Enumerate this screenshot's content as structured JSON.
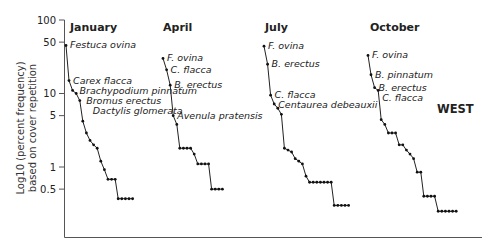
{
  "chart_data": {
    "type": "line",
    "title": "",
    "region_label": "WEST",
    "ylabel_line1": "Log10 (percent frequency)",
    "ylabel_line2": "based on cover repetition",
    "yscale": "log",
    "ylim": [
      0.2,
      100
    ],
    "yticks": [
      100,
      50,
      10,
      5,
      1,
      0.5
    ],
    "ytick_labels": [
      "100",
      "50",
      "10",
      "5",
      "1",
      "0.5"
    ],
    "xlabel": "",
    "grid": false,
    "legend": "none",
    "panels": [
      {
        "name": "January",
        "x_start": 66,
        "label_x": 70,
        "values": [
          45,
          15,
          11,
          10,
          8,
          4.2,
          2.9,
          2.3,
          2.0,
          1.8,
          1.2,
          0.92,
          0.68,
          0.68,
          0.68,
          0.37,
          0.37,
          0.37,
          0.37,
          0.37
        ],
        "annotations": [
          {
            "text": "Festuca ovina",
            "index": 0
          },
          {
            "text": "Carex flacca",
            "index": 1
          },
          {
            "text": "Brachypodium pinnatum",
            "index": 2
          },
          {
            "text": "Bromus erectus",
            "index": 3
          },
          {
            "text": "Dactylis glomerata",
            "index": 4
          }
        ]
      },
      {
        "name": "April",
        "x_start": 163,
        "label_x": 163,
        "values": [
          30,
          21,
          13,
          5.0,
          3.8,
          1.8,
          1.8,
          1.8,
          1.8,
          1.5,
          1.1,
          1.1,
          1.1,
          1.1,
          0.5,
          0.5,
          0.5,
          0.5
        ],
        "annotations": [
          {
            "text": "F. ovina",
            "index": 0
          },
          {
            "text": "C. flacca",
            "index": 1
          },
          {
            "text": "B. erectus",
            "index": 2
          },
          {
            "text": "Avenula pratensis",
            "index": 3
          }
        ]
      },
      {
        "name": "July",
        "x_start": 264,
        "label_x": 265,
        "values": [
          44,
          25,
          9.5,
          7.2,
          6.3,
          5.2,
          1.8,
          1.7,
          1.6,
          1.3,
          1.2,
          1.1,
          0.75,
          0.62,
          0.62,
          0.62,
          0.62,
          0.62,
          0.62,
          0.62,
          0.3,
          0.3,
          0.3,
          0.3,
          0.3
        ],
        "annotations": [
          {
            "text": "F. ovina",
            "index": 0
          },
          {
            "text": "B. erectus",
            "index": 1
          },
          {
            "text": "C. flacca",
            "index": 2
          },
          {
            "text": "Centaurea debeauxii",
            "index": 3
          }
        ]
      },
      {
        "name": "October",
        "x_start": 368,
        "label_x": 370,
        "values": [
          33,
          18,
          12,
          11,
          4.4,
          3.8,
          2.9,
          2.9,
          2.9,
          2.0,
          2.0,
          1.7,
          1.5,
          1.3,
          0.85,
          0.85,
          0.4,
          0.4,
          0.4,
          0.4,
          0.25,
          0.25,
          0.25,
          0.25,
          0.25,
          0.25
        ],
        "annotations": [
          {
            "text": "F. ovina",
            "index": 0
          },
          {
            "text": "B. pinnatum",
            "index": 1
          },
          {
            "text": "B. erectus",
            "index": 2
          },
          {
            "text": "C. flacca",
            "index": 3
          }
        ]
      }
    ]
  }
}
